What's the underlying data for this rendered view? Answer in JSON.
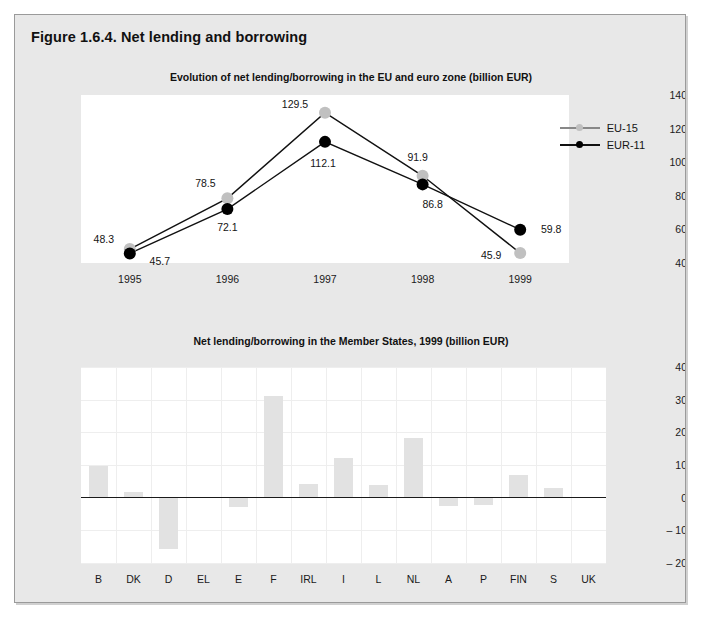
{
  "figure": {
    "title": "Figure 1.6.4. Net lending and borrowing"
  },
  "colors": {
    "frame_bg": "#e8e8e8",
    "plot_bg": "#ffffff",
    "eu15": "#c0c0c0",
    "eur11": "#000000",
    "bar_fill": "#e2e2e2",
    "grid": "#eeeeee",
    "axis": "#1a1a1a"
  },
  "chart_data": [
    {
      "id": "line-chart",
      "type": "line",
      "title": "Evolution of net lending/borrowing in the EU and euro zone (billion EUR)",
      "xlabel": "",
      "ylabel": "",
      "categories": [
        "1995",
        "1996",
        "1997",
        "1998",
        "1999"
      ],
      "ylim": [
        40,
        140
      ],
      "yticks": [
        "40",
        "60",
        "80",
        "100",
        "120",
        "140"
      ],
      "ytick_values": [
        40,
        60,
        80,
        100,
        120,
        140
      ],
      "grid": false,
      "legend_position": "top-right",
      "series": [
        {
          "name": "EU-15",
          "color": "#c0c0c0",
          "values": [
            48.3,
            78.5,
            129.5,
            91.9,
            45.9
          ],
          "labels": [
            "48.3",
            "78.5",
            "129.5",
            "91.9",
            "45.9"
          ],
          "label_offsets": [
            [
              -26,
              -10
            ],
            [
              -22,
              -15
            ],
            [
              -30,
              -9
            ],
            [
              -5,
              -19
            ],
            [
              -29,
              2
            ]
          ]
        },
        {
          "name": "EUR-11",
          "color": "#000000",
          "values": [
            45.7,
            72.1,
            112.1,
            86.8,
            59.8
          ],
          "labels": [
            "45.7",
            "72.1",
            "112.1",
            "86.8",
            "59.8"
          ],
          "label_offsets": [
            [
              30,
              8
            ],
            [
              0,
              18
            ],
            [
              -2,
              21
            ],
            [
              10,
              20
            ],
            [
              31,
              -1
            ]
          ]
        }
      ]
    },
    {
      "id": "bar-chart",
      "type": "bar",
      "title": "Net lending/borrowing in the Member States, 1999 (billion EUR)",
      "xlabel": "",
      "ylabel": "",
      "categories": [
        "B",
        "DK",
        "D",
        "EL",
        "E",
        "F",
        "IRL",
        "I",
        "L",
        "NL",
        "A",
        "P",
        "FIN",
        "S",
        "UK"
      ],
      "values": [
        9.6,
        1.8,
        -15.8,
        0.2,
        -2.8,
        31.0,
        4.1,
        12.1,
        4.0,
        18.2,
        -2.7,
        -2.3,
        7.0,
        3.0,
        0.0
      ],
      "ylim": [
        -20,
        40
      ],
      "yticks": [
        "40",
        "30",
        "20",
        "10",
        "0",
        "– 10",
        "– 20"
      ],
      "ytick_values": [
        40,
        30,
        20,
        10,
        0,
        -10,
        -20
      ],
      "grid": true,
      "legend_position": "none"
    }
  ]
}
